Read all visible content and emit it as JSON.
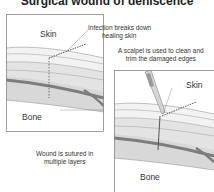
{
  "title": "Surgical wound of dehiscence",
  "panel_left": {
    "skin_label": "Skin",
    "bone_label": "Bone",
    "callout_top": [
      "Infection breaks down",
      "healing skin"
    ],
    "callout_bottom": [
      "Wound is sutured in",
      "multiple layers"
    ]
  },
  "panel_right": {
    "skin_label": "Skin",
    "bone_label": "Bone",
    "callout_top": [
      "A scalpel is used to clean and",
      "trim the damaged edges"
    ]
  },
  "colors": {
    "border": "#888888",
    "tissue_light": "#f0f0f0",
    "tissue_mid": "#dcdcdc",
    "tissue_dark": "#8a8a8a",
    "suture": "#555555"
  }
}
